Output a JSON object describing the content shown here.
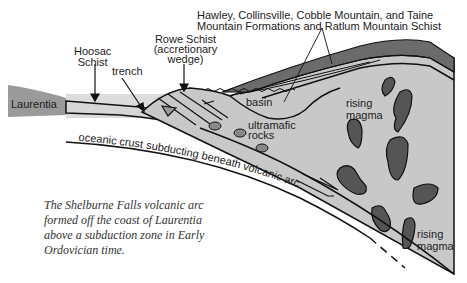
{
  "diagram": {
    "title_fragment": "VOLCANIC ARC",
    "labels": {
      "laurentia": "Laurentia",
      "hoosac_line1": "Hoosac",
      "hoosac_line2": "Schist",
      "trench": "trench",
      "rowe_line1": "Rowe Schist",
      "rowe_line2": "(accretionary",
      "rowe_line3": "wedge)",
      "formations_line1": "Hawley, Collinsville, Cobble Mountain, and Taine",
      "formations_line2": "Mountain Formations and Ratlum Mountain Schist",
      "basin": "basin",
      "ultramafic_line1": "ultramafic",
      "ultramafic_line2": "rocks",
      "rising_magma_upper_1": "rising",
      "rising_magma_upper_2": "magma",
      "rising_magma_lower_1": "rising",
      "rising_magma_lower_2": "magma",
      "oceanic_crust": "oceanic crust subducting beneath volcanic arc"
    },
    "caption": {
      "line1": "The Shelburne Falls volcanic arc",
      "line2": "formed off the coast of Laurentia",
      "line3": "above a subduction zone in Early",
      "line4": "Ordovician time."
    },
    "colors": {
      "arc_fill": "#c8c8c8",
      "dark_layer": "#6b6b6b",
      "magma": "#555555",
      "laurentia": "#9a9a9a",
      "water": "#dcdcdc",
      "outline": "#111111"
    }
  }
}
